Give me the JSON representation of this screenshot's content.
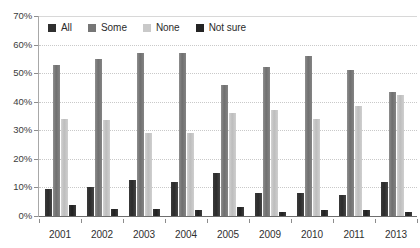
{
  "chart_data": {
    "type": "bar",
    "title": "",
    "subtitle": "",
    "xlabel": "",
    "ylabel": "",
    "ylim": [
      0,
      70
    ],
    "ytick_labels": [
      "70%",
      "60%",
      "50%",
      "40%",
      "30%",
      "20%",
      "10%",
      "0%"
    ],
    "ytick_values": [
      70,
      60,
      50,
      40,
      30,
      20,
      10,
      0
    ],
    "grid": true,
    "legend_position": "top-left-inside",
    "categories": [
      "2001",
      "2002",
      "2003",
      "2004",
      "2005",
      "2009",
      "2010",
      "2011",
      "2013"
    ],
    "series": [
      {
        "name": "All",
        "color": "#2f2f2f",
        "values": [
          9.5,
          10,
          12.5,
          12,
          15,
          8,
          8,
          7.5,
          12
        ]
      },
      {
        "name": "Some",
        "color": "#767676",
        "values": [
          53,
          55,
          57,
          57,
          46,
          52,
          56,
          51,
          43.5
        ]
      },
      {
        "name": "None",
        "color": "#c9c9c9",
        "values": [
          34,
          33.5,
          29,
          29,
          36,
          37,
          34,
          38.5,
          42.5
        ]
      },
      {
        "name": "Not sure",
        "color": "#242424",
        "values": [
          4,
          2.5,
          2.5,
          2,
          3,
          1.5,
          2,
          2,
          1.5
        ]
      }
    ]
  },
  "legend": {
    "items": [
      {
        "label": "All",
        "swatch_class": "s-all"
      },
      {
        "label": "Some",
        "swatch_class": "s-some"
      },
      {
        "label": "None",
        "swatch_class": "s-none"
      },
      {
        "label": "Not sure",
        "swatch_class": "s-notsure"
      }
    ]
  }
}
